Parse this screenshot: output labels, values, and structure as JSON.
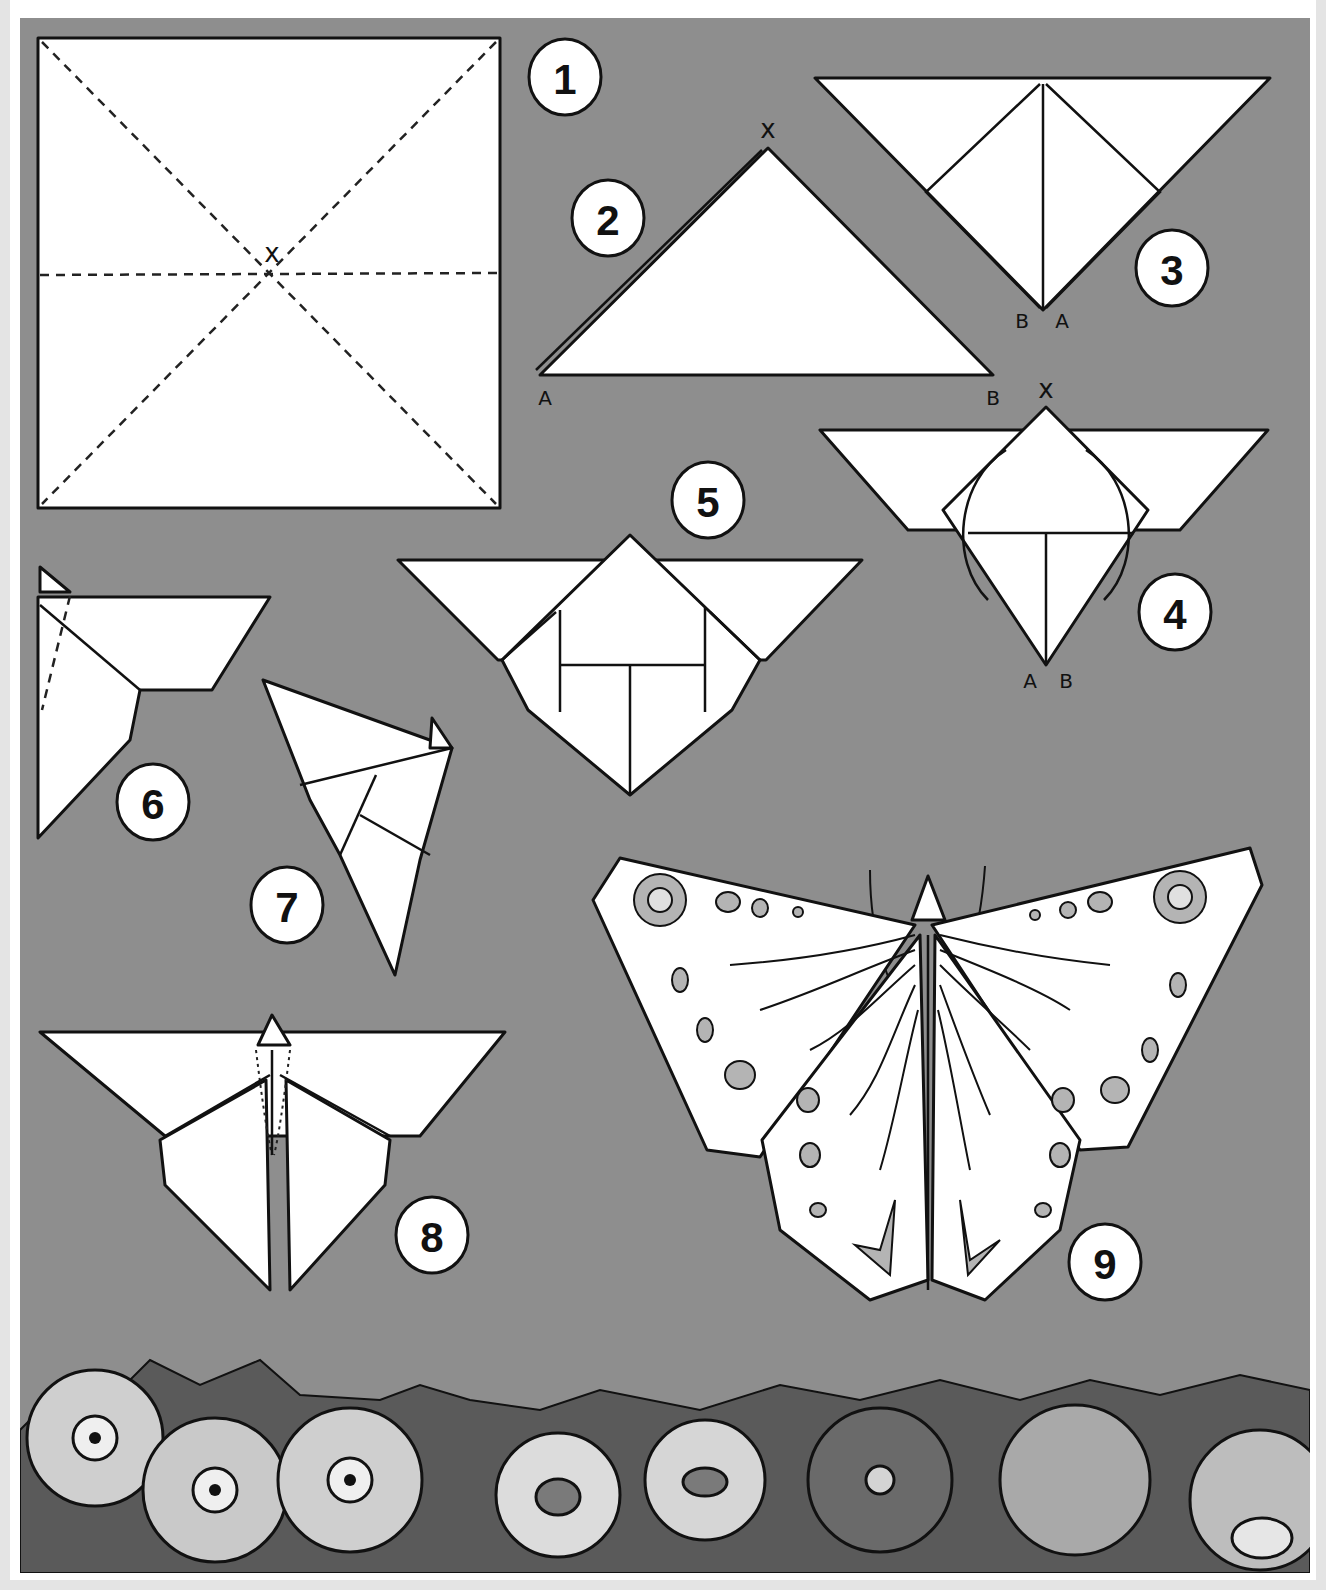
{
  "diagram": {
    "colors": {
      "background_panel": "#8e8e8e",
      "paper": "#ffffff",
      "outline": "#111111",
      "frame": "#ffffff",
      "outer_margin": "#e4e4e4",
      "wing_spots": "#b4b4b4"
    },
    "steps": [
      {
        "number": "1",
        "label": "1",
        "marks": [
          "x"
        ]
      },
      {
        "number": "2",
        "label": "2",
        "marks": [
          "x",
          "A",
          "B"
        ]
      },
      {
        "number": "3",
        "label": "3",
        "marks": [
          "B",
          "A"
        ]
      },
      {
        "number": "4",
        "label": "4",
        "marks": [
          "x",
          "A",
          "B"
        ]
      },
      {
        "number": "5",
        "label": "5",
        "marks": []
      },
      {
        "number": "6",
        "label": "6",
        "marks": []
      },
      {
        "number": "7",
        "label": "7",
        "marks": []
      },
      {
        "number": "8",
        "label": "8",
        "marks": []
      },
      {
        "number": "9",
        "label": "9",
        "marks": []
      }
    ],
    "point_labels": {
      "step1_center": "x",
      "step2_apex": "x",
      "step2_left": "A",
      "step2_right": "B",
      "step3_left": "B",
      "step3_right": "A",
      "step4_apex": "x",
      "step4_left": "A",
      "step4_right": "B"
    },
    "decoration": "flower border along bottom"
  }
}
